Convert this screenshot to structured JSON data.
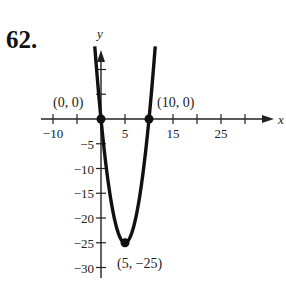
{
  "problem_number": "62.",
  "chart_data": {
    "type": "line",
    "title": "",
    "equation_hint": "parabola through (0,0), (10,0), vertex (5,-25)",
    "xlabel": "x",
    "ylabel": "y",
    "xlim": [
      -12,
      35
    ],
    "ylim": [
      -32,
      14
    ],
    "x_ticks": [
      -10,
      -5,
      5,
      10,
      15,
      20,
      25,
      30
    ],
    "x_tick_labels": [
      {
        "value": -10,
        "label": "−10"
      },
      {
        "value": 5,
        "label": "5"
      },
      {
        "value": 15,
        "label": "15"
      },
      {
        "value": 25,
        "label": "25"
      }
    ],
    "y_ticks": [
      10,
      5,
      -5,
      -10,
      -15,
      -20,
      -25,
      -30
    ],
    "y_tick_labels": [
      {
        "value": -5,
        "label": "−5"
      },
      {
        "value": -10,
        "label": "−10"
      },
      {
        "value": -15,
        "label": "−15"
      },
      {
        "value": -20,
        "label": "−20"
      },
      {
        "value": -25,
        "label": "−25"
      },
      {
        "value": -30,
        "label": "−30"
      }
    ],
    "grid": false,
    "series": [
      {
        "name": "y = x^2 - 10x",
        "x": [
          -1.2,
          0,
          2,
          5,
          8,
          10,
          11.2
        ],
        "y": [
          13.4,
          0,
          -16,
          -25,
          -16,
          0,
          13.4
        ]
      }
    ],
    "points": [
      {
        "x": 0,
        "y": 0,
        "label": "(0, 0)"
      },
      {
        "x": 10,
        "y": 0,
        "label": "(10, 0)"
      },
      {
        "x": 5,
        "y": -25,
        "label": "(5, −25)"
      }
    ]
  }
}
